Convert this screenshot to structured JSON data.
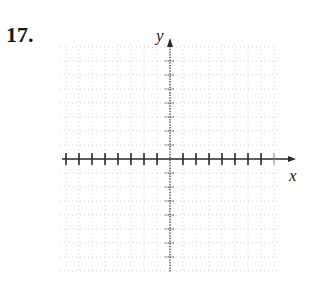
{
  "problem": {
    "number": "17."
  },
  "graph": {
    "x_label": "x",
    "y_label": "y",
    "origin_px": [
      170,
      159
    ],
    "x_tick_spacing_px": 13,
    "y_tick_spacing_px": 14,
    "x_ticks_left": 8,
    "x_ticks_right": 8,
    "y_ticks_up": 8,
    "y_ticks_down": 8,
    "grid": {
      "left": 60,
      "right": 280,
      "top": 45,
      "bottom": 272,
      "style": "dotted",
      "color": "#c8c8c8"
    },
    "axis_color": "#2a2a2a"
  }
}
